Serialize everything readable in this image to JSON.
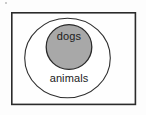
{
  "diagram": {
    "type": "venn-subset",
    "title": "",
    "background_color": "#fdfdfd",
    "frame": {
      "name": "universe-frame",
      "x": 11,
      "y": 12,
      "width": 125,
      "height": 93,
      "fill": "#fefefe",
      "stroke": "#2b2b2b"
    },
    "sets": [
      {
        "id": "animals",
        "label": "animals",
        "shape": "ellipse",
        "cx": 67.5,
        "cy": 58,
        "rx": 43,
        "ry": 40,
        "fill": "#ffffff",
        "stroke": "#2f2f2f",
        "label_x": 69,
        "label_y": 79
      },
      {
        "id": "dogs",
        "label": "dogs",
        "shape": "circle",
        "cx": 69,
        "cy": 47,
        "rx": 23,
        "ry": 22.5,
        "fill": "#a8a8a8",
        "stroke": "#2b2b2b",
        "label_x": 69,
        "label_y": 37
      }
    ],
    "relation": "dogs is a subset of animals"
  }
}
